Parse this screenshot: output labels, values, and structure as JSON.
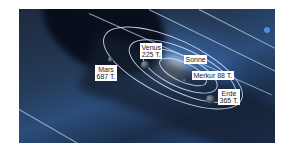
{
  "figure": {
    "labels": {
      "sun": "Sonne",
      "mercury": "Merkur 88 T.",
      "venus_name": "Venus",
      "venus_period": "225 T.",
      "earth_name": "Erde",
      "earth_period": "365 T.",
      "mars_name": "Mars",
      "mars_period": "687 T."
    },
    "colors": {
      "background_dark": "#1c2a3d",
      "glow": "#aacdf5",
      "orbit_line": "#d7e6fa",
      "label_bg": "#ffffff"
    }
  }
}
